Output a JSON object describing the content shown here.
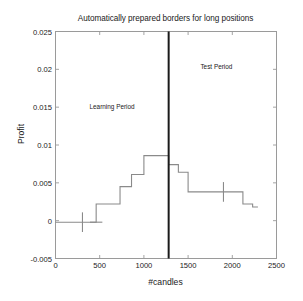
{
  "chart_data": {
    "type": "line",
    "title": "Automatically prepared borders for long positions",
    "xlabel": "#candles",
    "ylabel": "Profit",
    "xlim": [
      0,
      2500
    ],
    "ylim": [
      -0.005,
      0.025
    ],
    "xticks": [
      0,
      500,
      1000,
      1500,
      2000,
      2500
    ],
    "xtick_labels": [
      "0",
      "500",
      "1000",
      "1500",
      "2000",
      "2500"
    ],
    "yticks": [
      -0.005,
      0,
      0.005,
      0.01,
      0.015,
      0.02,
      0.025
    ],
    "ytick_labels": [
      "-0.005",
      "0",
      "0.005",
      "0.01",
      "0.015",
      "0.02",
      "0.025"
    ],
    "grid": false,
    "legend": null,
    "series": [
      {
        "name": "Prepared border (staircase)",
        "drawstyle": "steps-post",
        "color": "#8a8a8a",
        "x": [
          0,
          460,
          460,
          730,
          730,
          860,
          860,
          1000,
          1000,
          1280,
          1280,
          1390,
          1390,
          1500,
          1500,
          2120,
          2120,
          2230,
          2230,
          2290
        ],
        "y": [
          -0.0002,
          -0.0002,
          0.0022,
          0.0022,
          0.0045,
          0.0045,
          0.0061,
          0.0061,
          0.0086,
          0.0086,
          0.0074,
          0.0074,
          0.0064,
          0.0064,
          0.0038,
          0.0038,
          0.0022,
          0.0022,
          0.0018,
          0.0018
        ]
      }
    ],
    "steps": [
      {
        "x_start": 0,
        "x_end": 460,
        "value": -0.0002
      },
      {
        "x_start": 460,
        "x_end": 730,
        "value": 0.0022
      },
      {
        "x_start": 730,
        "x_end": 860,
        "value": 0.0045
      },
      {
        "x_start": 860,
        "x_end": 1000,
        "value": 0.0061
      },
      {
        "x_start": 1000,
        "x_end": 1280,
        "value": 0.0086
      },
      {
        "x_start": 1280,
        "x_end": 1390,
        "value": 0.0074
      },
      {
        "x_start": 1390,
        "x_end": 1500,
        "value": 0.0064
      },
      {
        "x_start": 1500,
        "x_end": 2120,
        "value": 0.0038
      },
      {
        "x_start": 2120,
        "x_end": 2230,
        "value": 0.0022
      },
      {
        "x_start": 2230,
        "x_end": 2290,
        "value": 0.0018
      }
    ],
    "errorbars": [
      {
        "x": 305,
        "y": -0.0002,
        "yerr": 0.0013,
        "cap_half_width": 0
      },
      {
        "x": 460,
        "y": -0.0002,
        "yerr": 0.0,
        "cap_half_width": 70
      },
      {
        "x": 1900,
        "y": 0.0038,
        "yerr": 0.0013,
        "cap_half_width": 0
      }
    ],
    "vlines": [
      {
        "x": 1280,
        "color": "#1a1a1a",
        "width": 2,
        "label": "learning/test split"
      }
    ],
    "annotations": [
      {
        "text": "Learning Period",
        "x": 640,
        "y": 0.0152
      },
      {
        "text": "Test Period",
        "x": 1820,
        "y": 0.0205
      }
    ]
  },
  "colors": {
    "line": "#8a8a8a",
    "axis": "#9a9a9a",
    "divider": "#1a1a1a",
    "text": "#1a1a1a",
    "background": "#ffffff"
  }
}
